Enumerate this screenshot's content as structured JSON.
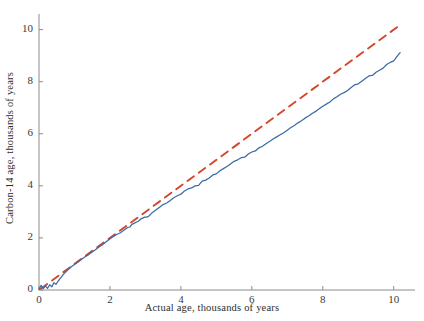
{
  "chart_data": {
    "type": "line",
    "title": "",
    "xlabel": "Actual age, thousands of years",
    "ylabel": "Carbon-14 age, thousands of years",
    "xlim": [
      0,
      10.6
    ],
    "ylim": [
      0,
      10.6
    ],
    "xticks": [
      0,
      2,
      4,
      6,
      8,
      10
    ],
    "xticklabels": [
      "0",
      "2",
      "4",
      "6",
      "8",
      "10"
    ],
    "yticks": [
      0,
      2,
      4,
      6,
      8,
      10
    ],
    "yticklabels": [
      "0",
      "2",
      "4",
      "6",
      "8",
      "10"
    ],
    "grid": false,
    "legend": null,
    "colors": {
      "calibration_curve": "#3b6ba5",
      "identity_line": "#d4462c",
      "axis": "#8c8c8c",
      "text": "#2e2e2e",
      "background": "#ffffff"
    },
    "series": [
      {
        "name": "identity-line",
        "style": "dashed",
        "color": "#d4462c",
        "x": [
          0.05,
          10.2
        ],
        "y": [
          0.05,
          10.2
        ]
      },
      {
        "name": "calibration-curve",
        "style": "solid",
        "color": "#3b6ba5",
        "x": [
          0.0,
          0.06,
          0.12,
          0.18,
          0.24,
          0.3,
          0.36,
          0.42,
          0.48,
          0.54,
          0.6,
          0.7,
          0.8,
          0.9,
          1.0,
          1.1,
          1.2,
          1.3,
          1.4,
          1.5,
          1.6,
          1.7,
          1.8,
          1.9,
          2.0,
          2.1,
          2.2,
          2.3,
          2.4,
          2.5,
          2.56,
          2.62,
          2.68,
          2.74,
          2.8,
          2.86,
          2.92,
          2.98,
          3.04,
          3.1,
          3.2,
          3.3,
          3.4,
          3.5,
          3.6,
          3.7,
          3.8,
          3.9,
          4.0,
          4.1,
          4.2,
          4.3,
          4.4,
          4.5,
          4.6,
          4.7,
          4.8,
          4.9,
          5.0,
          5.1,
          5.2,
          5.3,
          5.4,
          5.5,
          5.6,
          5.7,
          5.8,
          5.9,
          6.0,
          6.1,
          6.2,
          6.3,
          6.4,
          6.5,
          6.6,
          6.7,
          6.8,
          6.9,
          7.0,
          7.1,
          7.2,
          7.3,
          7.4,
          7.5,
          7.6,
          7.7,
          7.8,
          7.9,
          8.0,
          8.1,
          8.2,
          8.3,
          8.4,
          8.5,
          8.6,
          8.7,
          8.8,
          8.9,
          9.0,
          9.1,
          9.2,
          9.3,
          9.4,
          9.5,
          9.6,
          9.7,
          9.8,
          9.9,
          10.0,
          10.1,
          10.18
        ],
        "y": [
          0.02,
          0.18,
          0.05,
          0.16,
          0.06,
          0.2,
          0.12,
          0.28,
          0.22,
          0.34,
          0.45,
          0.62,
          0.76,
          0.88,
          0.98,
          1.08,
          1.18,
          1.28,
          1.36,
          1.46,
          1.56,
          1.66,
          1.75,
          1.86,
          1.96,
          2.06,
          2.14,
          2.2,
          2.3,
          2.4,
          2.42,
          2.52,
          2.56,
          2.6,
          2.64,
          2.72,
          2.76,
          2.8,
          2.8,
          2.84,
          2.98,
          3.08,
          3.18,
          3.28,
          3.34,
          3.44,
          3.54,
          3.62,
          3.68,
          3.8,
          3.88,
          3.92,
          4.0,
          4.02,
          4.18,
          4.22,
          4.3,
          4.42,
          4.46,
          4.58,
          4.66,
          4.74,
          4.84,
          4.94,
          5.0,
          5.08,
          5.1,
          5.22,
          5.3,
          5.34,
          5.46,
          5.52,
          5.62,
          5.7,
          5.8,
          5.88,
          5.96,
          6.04,
          6.14,
          6.24,
          6.32,
          6.42,
          6.5,
          6.6,
          6.68,
          6.78,
          6.86,
          6.96,
          7.06,
          7.14,
          7.22,
          7.34,
          7.42,
          7.52,
          7.58,
          7.66,
          7.78,
          7.88,
          7.92,
          8.02,
          8.12,
          8.22,
          8.24,
          8.36,
          8.44,
          8.52,
          8.66,
          8.74,
          8.8,
          8.98,
          9.12
        ]
      }
    ]
  },
  "axes": {
    "x_title": "Actual age, thousands of years",
    "y_title": "Carbon-14 age, thousands of years",
    "x_tick_labels": [
      "0",
      "2",
      "4",
      "6",
      "8",
      "10"
    ],
    "y_tick_labels": [
      "0",
      "2",
      "4",
      "6",
      "8",
      "10"
    ]
  }
}
